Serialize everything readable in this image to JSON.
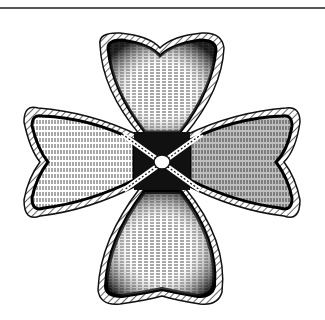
{
  "image": {
    "subject": "heraldic cross with four rounded lobed arms bordered by rope, tied at center with a knot",
    "style": "black and white engraving / hatched illustration",
    "colors": {
      "ink": "#111111",
      "paper": "#ffffff",
      "rule": "#555555"
    }
  }
}
